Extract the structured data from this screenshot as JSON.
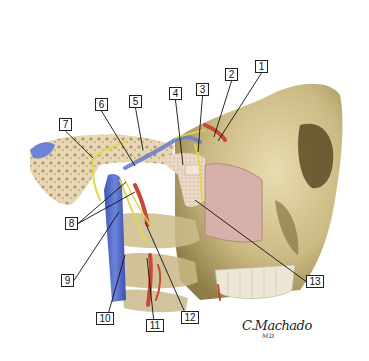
{
  "figure": {
    "type": "anatomical-illustration",
    "signature": "C.Machado",
    "signature_suffix": "M.D."
  },
  "colors": {
    "background": "#ffffff",
    "bone": "#d8c99a",
    "bone_shadow": "#9b8a55",
    "bone_dark": "#6e5f34",
    "cancellous_bone": "#e8d9c0",
    "sinus_mucosa": "#d9b3ad",
    "vein": "#4a63c8",
    "vein_light": "#7f93de",
    "artery": "#c8473a",
    "nerve": "#e3d84a",
    "teeth": "#ece7da",
    "label_border": "#222222",
    "leader_line": "#111111"
  },
  "callouts": [
    {
      "id": "1",
      "label": "1",
      "box": {
        "x": 255,
        "y": 60,
        "w": 13,
        "h": 13
      },
      "target": {
        "x": 218,
        "y": 141
      }
    },
    {
      "id": "2",
      "label": "2",
      "box": {
        "x": 225,
        "y": 68,
        "w": 13,
        "h": 13
      },
      "target": {
        "x": 214,
        "y": 137
      }
    },
    {
      "id": "3",
      "label": "3",
      "box": {
        "x": 196,
        "y": 83,
        "w": 13,
        "h": 13
      },
      "target": {
        "x": 198,
        "y": 152
      }
    },
    {
      "id": "4",
      "label": "4",
      "box": {
        "x": 169,
        "y": 87,
        "w": 13,
        "h": 13
      },
      "target": {
        "x": 183,
        "y": 165
      }
    },
    {
      "id": "5",
      "label": "5",
      "box": {
        "x": 129,
        "y": 95,
        "w": 13,
        "h": 13
      },
      "target": {
        "x": 143,
        "y": 150
      }
    },
    {
      "id": "6",
      "label": "6",
      "box": {
        "x": 95,
        "y": 98,
        "w": 13,
        "h": 13
      },
      "target": {
        "x": 135,
        "y": 166
      }
    },
    {
      "id": "7",
      "label": "7",
      "box": {
        "x": 59,
        "y": 118,
        "w": 13,
        "h": 13
      },
      "target": {
        "x": 93,
        "y": 158
      }
    },
    {
      "id": "8",
      "label": "8",
      "box": {
        "x": 65,
        "y": 217,
        "w": 13,
        "h": 13
      },
      "target": {
        "x": 126,
        "y": 182
      },
      "target2": {
        "x": 135,
        "y": 192
      }
    },
    {
      "id": "9",
      "label": "9",
      "box": {
        "x": 61,
        "y": 274,
        "w": 13,
        "h": 13
      },
      "target": {
        "x": 119,
        "y": 212
      }
    },
    {
      "id": "10",
      "label": "10",
      "box": {
        "x": 96,
        "y": 312,
        "w": 18,
        "h": 13
      },
      "target": {
        "x": 125,
        "y": 255
      }
    },
    {
      "id": "11",
      "label": "11",
      "box": {
        "x": 146,
        "y": 319,
        "w": 18,
        "h": 13
      },
      "target": {
        "x": 147,
        "y": 258
      }
    },
    {
      "id": "12",
      "label": "12",
      "box": {
        "x": 181,
        "y": 311,
        "w": 18,
        "h": 13
      },
      "target": {
        "x": 145,
        "y": 222
      }
    },
    {
      "id": "13",
      "label": "13",
      "box": {
        "x": 306,
        "y": 275,
        "w": 18,
        "h": 13
      },
      "target": {
        "x": 195,
        "y": 200
      }
    }
  ]
}
